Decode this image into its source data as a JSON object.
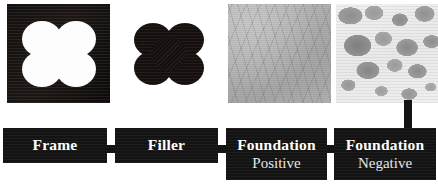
{
  "figure": {
    "background_color": "#ffffff",
    "box_color": "#131313",
    "text_color": "#ffffff",
    "secondary_text_color": "#e6e6e6"
  },
  "panels": [
    {
      "id": "frame",
      "icon_name": "black-square-with-white-cross-cutout",
      "description": "Dark square block with a white four-lobed cross-shaped void"
    },
    {
      "id": "filler",
      "icon_name": "black-cross-shape",
      "description": "Black four-lobed cross shape on white background"
    },
    {
      "id": "foundation-positive",
      "icon_name": "grey-woven-texture",
      "description": "Mid-grey fibrous woven surface texture"
    },
    {
      "id": "foundation-negative",
      "icon_name": "light-mottled-texture",
      "description": "Light speckled surface with grey blob inclusions"
    }
  ],
  "labels": [
    {
      "primary": "Frame",
      "secondary": ""
    },
    {
      "primary": "Filler",
      "secondary": ""
    },
    {
      "primary": "Foundation",
      "secondary": "Positive"
    },
    {
      "primary": "Foundation",
      "secondary": "Negative"
    }
  ]
}
